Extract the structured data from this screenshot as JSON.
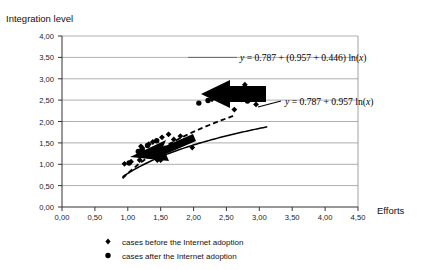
{
  "chart_data": {
    "type": "scatter",
    "title": "",
    "xlabel": "Efforts",
    "ylabel": "Integration level",
    "xlim": [
      0.0,
      4.5
    ],
    "ylim": [
      0.0,
      4.0
    ],
    "grid": true,
    "grid_axis": "y",
    "legend_position": "bottom",
    "x_ticks": [
      "0,00",
      "0,50",
      "1,00",
      "1,50",
      "2,00",
      "2,50",
      "3,00",
      "3,50",
      "4,00",
      "4,50"
    ],
    "x_tick_values": [
      0.0,
      0.5,
      1.0,
      1.5,
      2.0,
      2.5,
      3.0,
      3.5,
      4.0,
      4.5
    ],
    "y_ticks": [
      "0,00",
      "0,50",
      "1,00",
      "1,50",
      "2,00",
      "2,50",
      "3,00",
      "3,50",
      "4,00"
    ],
    "y_tick_values": [
      0.0,
      0.5,
      1.0,
      1.5,
      2.0,
      2.5,
      3.0,
      3.5,
      4.0
    ],
    "series": [
      {
        "name": "cases before the Internet adoption",
        "marker": "diamond",
        "color": "#000000",
        "points": [
          [
            0.95,
            1.01
          ],
          [
            1.05,
            1.06
          ],
          [
            1.18,
            1.1
          ],
          [
            1.2,
            1.25
          ],
          [
            1.22,
            1.38
          ],
          [
            1.2,
            1.42
          ],
          [
            1.32,
            1.47
          ],
          [
            1.38,
            1.52
          ],
          [
            1.45,
            1.1
          ],
          [
            1.5,
            1.1
          ],
          [
            1.52,
            1.63
          ],
          [
            1.62,
            1.7
          ],
          [
            1.7,
            1.58
          ],
          [
            1.8,
            1.66
          ],
          [
            1.98,
            1.39
          ],
          [
            2.28,
            2.52
          ],
          [
            2.42,
            2.63
          ],
          [
            2.5,
            2.72
          ],
          [
            2.62,
            2.28
          ],
          [
            2.78,
            2.86
          ],
          [
            2.95,
            2.4
          ],
          [
            3.02,
            2.6
          ]
        ]
      },
      {
        "name": "cases after the Internet adoption",
        "marker": "circle",
        "color": "#000000",
        "points": [
          [
            1.02,
            1.03
          ],
          [
            1.16,
            1.3
          ],
          [
            1.22,
            1.34
          ],
          [
            1.3,
            1.44
          ],
          [
            1.44,
            1.55
          ],
          [
            2.08,
            2.43
          ],
          [
            2.22,
            2.49
          ],
          [
            2.35,
            2.58
          ],
          [
            2.52,
            2.72
          ],
          [
            2.82,
            2.48
          ]
        ]
      }
    ],
    "curves": [
      {
        "name": "baseline-log-fit",
        "style": "solid",
        "equation": "y = 0.787 + 0.957 ln(x)",
        "intercept": 0.787,
        "coefficient": 0.957,
        "x_range": [
          0.92,
          3.12
        ]
      },
      {
        "name": "internet-adoption-log-fit",
        "style": "dashed",
        "equation": "y = 0.787 + (0.957 + 0.446) ln(x)",
        "intercept": 0.787,
        "coefficient": 1.403,
        "coefficient_parts": [
          0.957,
          0.446
        ],
        "x_range": [
          0.92,
          2.62
        ]
      }
    ],
    "annotations": [
      {
        "name": "upper-equation",
        "text_parts": {
          "y": "y",
          "body": " = 0.787 + (0.957 + 0.446) ln(",
          "x": "x",
          "tail": ")"
        },
        "full_text": "y = 0.787 + (0.957 + 0.446) ln(x)"
      },
      {
        "name": "lower-equation",
        "text_parts": {
          "y": "y",
          "body": " = 0.787 + 0.957 ln(",
          "x": "x",
          "tail": ")"
        },
        "full_text": "y = 0.787 + 0.957 ln(x)"
      },
      {
        "name": "lower-arrow",
        "type": "arrow",
        "direction": "left-up"
      },
      {
        "name": "upper-arrow",
        "type": "arrow",
        "direction": "left"
      }
    ]
  },
  "legend": {
    "items": [
      {
        "label": "cases before the Internet adoption",
        "marker": "diamond"
      },
      {
        "label": "cases after the Internet adoption",
        "marker": "circle"
      }
    ]
  }
}
